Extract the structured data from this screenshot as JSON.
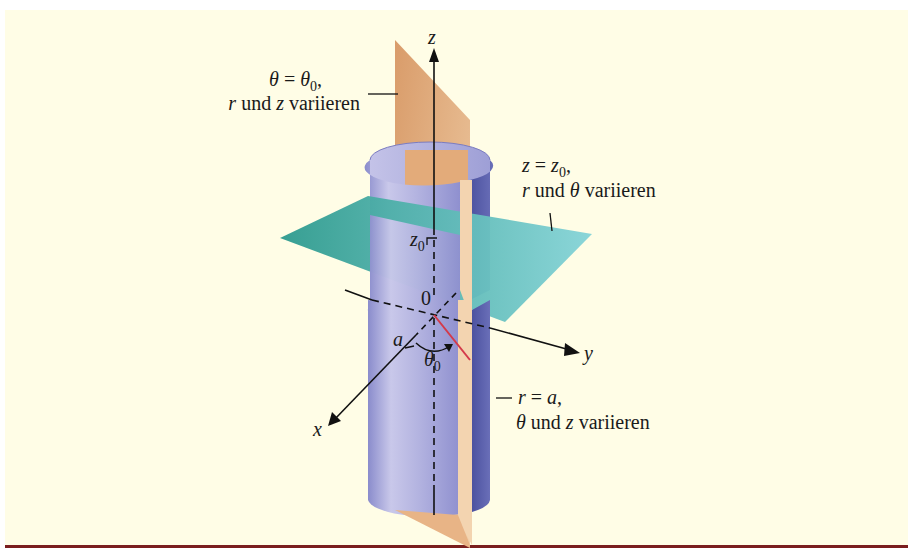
{
  "figure": {
    "background": "#fffde6",
    "bottom_rule_color": "#7a1e1e",
    "colors": {
      "cylinder_light": "#c9c8ea",
      "cylinder_mid": "#9b9bd4",
      "cylinder_dark": "#5a5fa8",
      "half_plane": "#e8b486",
      "half_plane_light": "#f3d4b0",
      "horizontal_plane": "#3aa79d",
      "horizontal_plane_light": "#7fd0d0",
      "axis": "#111111",
      "angle_marker": "#d43a4a"
    },
    "axes": {
      "z_label": "z",
      "y_label": "y",
      "x_label": "x",
      "origin_label": "0"
    },
    "annotations": {
      "half_plane": {
        "line1_lhs": "θ",
        "line1_eq": " = ",
        "line1_rhs": "θ",
        "line1_sub": "0",
        "line1_tail": ",",
        "line2_var1": "r",
        "line2_mid": " und ",
        "line2_var2": "z",
        "line2_tail": " variieren"
      },
      "horizontal_plane": {
        "line1_lhs": "z",
        "line1_eq": " = ",
        "line1_rhs": "z",
        "line1_sub": "0",
        "line1_tail": ",",
        "line2_var1": "r",
        "line2_mid": " und ",
        "line2_var2": "θ",
        "line2_tail": " variieren"
      },
      "cylinder": {
        "line1_lhs": "r",
        "line1_eq": " = ",
        "line1_rhs": "a",
        "line1_tail": ",",
        "line2_var1": "θ",
        "line2_mid": " und ",
        "line2_var2": "z",
        "line2_tail": " variieren"
      },
      "z0_marker": {
        "base": "z",
        "sub": "0"
      },
      "radius_marker": "a",
      "angle_marker": {
        "base": "θ",
        "sub": "0"
      }
    }
  }
}
